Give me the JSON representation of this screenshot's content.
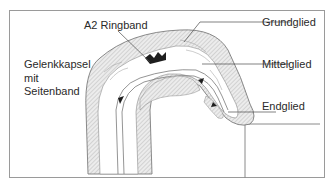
{
  "figure": {
    "labels": {
      "a2_ringband": "A2 Ringband",
      "gelenkkapsel_line1": "Gelenkkapsel",
      "gelenkkapsel_line2": "mit",
      "gelenkkapsel_line3": "Seitenband",
      "grundglied": "Grundglied",
      "mittelglied": "Mittelglied",
      "endglied": "Endglied"
    },
    "colors": {
      "frame": "#9a9a9a",
      "outline": "#6e6e6e",
      "hatch_fill": "#d4d4d4",
      "text": "#2a2a2a"
    }
  }
}
